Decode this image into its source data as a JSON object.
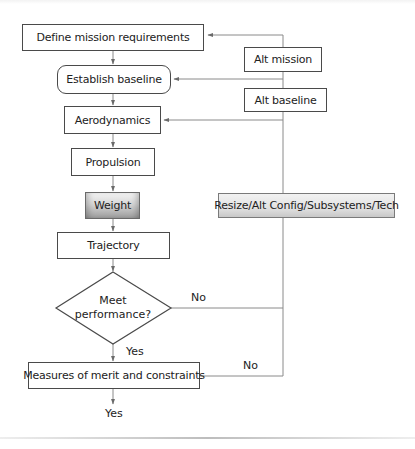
{
  "flowchart": {
    "nodes": {
      "define": {
        "label": "Define mission requirements",
        "shape": "rectangle"
      },
      "baseline": {
        "label": "Establish baseline",
        "shape": "rounded-rectangle"
      },
      "aero": {
        "label": "Aerodynamics",
        "shape": "rectangle"
      },
      "propulsion": {
        "label": "Propulsion",
        "shape": "rectangle"
      },
      "weight": {
        "label": "Weight",
        "shape": "rectangle-shaded"
      },
      "trajectory": {
        "label": "Trajectory",
        "shape": "rectangle"
      },
      "decision": {
        "line1": "Meet",
        "line2": "performance?",
        "shape": "diamond"
      },
      "measures": {
        "label": "Measures of merit and constraints",
        "shape": "rectangle"
      },
      "alt_mission": {
        "label": "Alt mission",
        "shape": "rectangle"
      },
      "alt_baseline": {
        "label": "Alt baseline",
        "shape": "rectangle"
      },
      "resize": {
        "label": "Resize/Alt Config/Subsystems/Tech",
        "shape": "rectangle-shaded"
      }
    },
    "edge_labels": {
      "decision_no": "No",
      "decision_yes": "Yes",
      "measures_no": "No",
      "measures_yes": "Yes"
    },
    "colors": {
      "box_border": "#4a4a4a",
      "connector": "#8a8a8a",
      "text": "#222222",
      "shaded_box": "#c8c8c8"
    },
    "edges": [
      [
        "define",
        "baseline"
      ],
      [
        "baseline",
        "aero"
      ],
      [
        "aero",
        "propulsion"
      ],
      [
        "propulsion",
        "weight"
      ],
      [
        "weight",
        "trajectory"
      ],
      [
        "trajectory",
        "decision"
      ],
      [
        "decision",
        "measures",
        "Yes"
      ],
      [
        "decision",
        "resize-loop",
        "No"
      ],
      [
        "measures",
        "resize-loop",
        "No"
      ],
      [
        "measures",
        "exit",
        "Yes"
      ],
      [
        "loop",
        "define"
      ],
      [
        "loop",
        "baseline"
      ],
      [
        "loop",
        "aero"
      ]
    ]
  }
}
